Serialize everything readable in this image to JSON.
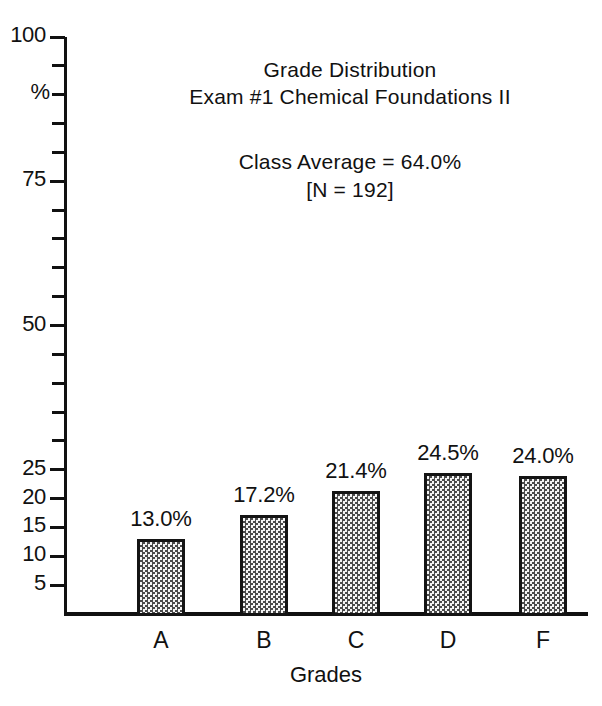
{
  "chart_data": {
    "type": "bar",
    "title": "Grade Distribution",
    "subtitle": "Exam #1 Chemical Foundations II",
    "annotations": [
      "Class Average = 64.0%",
      "[N = 192]"
    ],
    "class_average": "64.0%",
    "n_label": "[N = 192]",
    "xlabel": "Grades",
    "ylabel": "%",
    "categories": [
      "A",
      "B",
      "C",
      "D",
      "F"
    ],
    "values": [
      13.0,
      17.2,
      21.4,
      24.5,
      24.0
    ],
    "value_labels": [
      "13.0%",
      "17.2%",
      "21.4%",
      "24.5%",
      "24.0%"
    ],
    "ylim": [
      0,
      100
    ],
    "y_tick_labels": [
      "5",
      "10",
      "15",
      "20",
      "25",
      "50",
      "75",
      "100"
    ],
    "y_tick_values": [
      5,
      10,
      15,
      20,
      25,
      50,
      75,
      100
    ],
    "y_minor_tick_interval": 5,
    "grid": false,
    "legend": "none",
    "bar_fill": "#e8e8e8",
    "bar_edge": "#141414",
    "axis_color": "#111111",
    "background": "#ffffff"
  },
  "ticks": [
    {
      "value": 100,
      "label": "100",
      "major": true
    },
    {
      "value": 95,
      "label": "",
      "major": false
    },
    {
      "value": 90,
      "label": "",
      "major": false
    },
    {
      "value": 85,
      "label": "",
      "major": false
    },
    {
      "value": 80,
      "label": "",
      "major": false
    },
    {
      "value": 75,
      "label": "75",
      "major": true
    },
    {
      "value": 70,
      "label": "",
      "major": false
    },
    {
      "value": 65,
      "label": "",
      "major": false
    },
    {
      "value": 60,
      "label": "",
      "major": false
    },
    {
      "value": 55,
      "label": "",
      "major": false
    },
    {
      "value": 50,
      "label": "50",
      "major": true
    },
    {
      "value": 45,
      "label": "",
      "major": false
    },
    {
      "value": 40,
      "label": "",
      "major": false
    },
    {
      "value": 35,
      "label": "",
      "major": false
    },
    {
      "value": 30,
      "label": "",
      "major": false
    },
    {
      "value": 25,
      "label": "25",
      "major": true
    },
    {
      "value": 20,
      "label": "20",
      "major": true
    },
    {
      "value": 15,
      "label": "15",
      "major": true
    },
    {
      "value": 10,
      "label": "10",
      "major": true
    },
    {
      "value": 5,
      "label": "5",
      "major": true
    }
  ],
  "geometry": {
    "y_top_px": 37,
    "y_base_px": 614,
    "axis_x_px": 64,
    "bar_width_px": 48,
    "bar_centers_px": [
      161,
      264,
      356,
      448,
      543
    ]
  }
}
